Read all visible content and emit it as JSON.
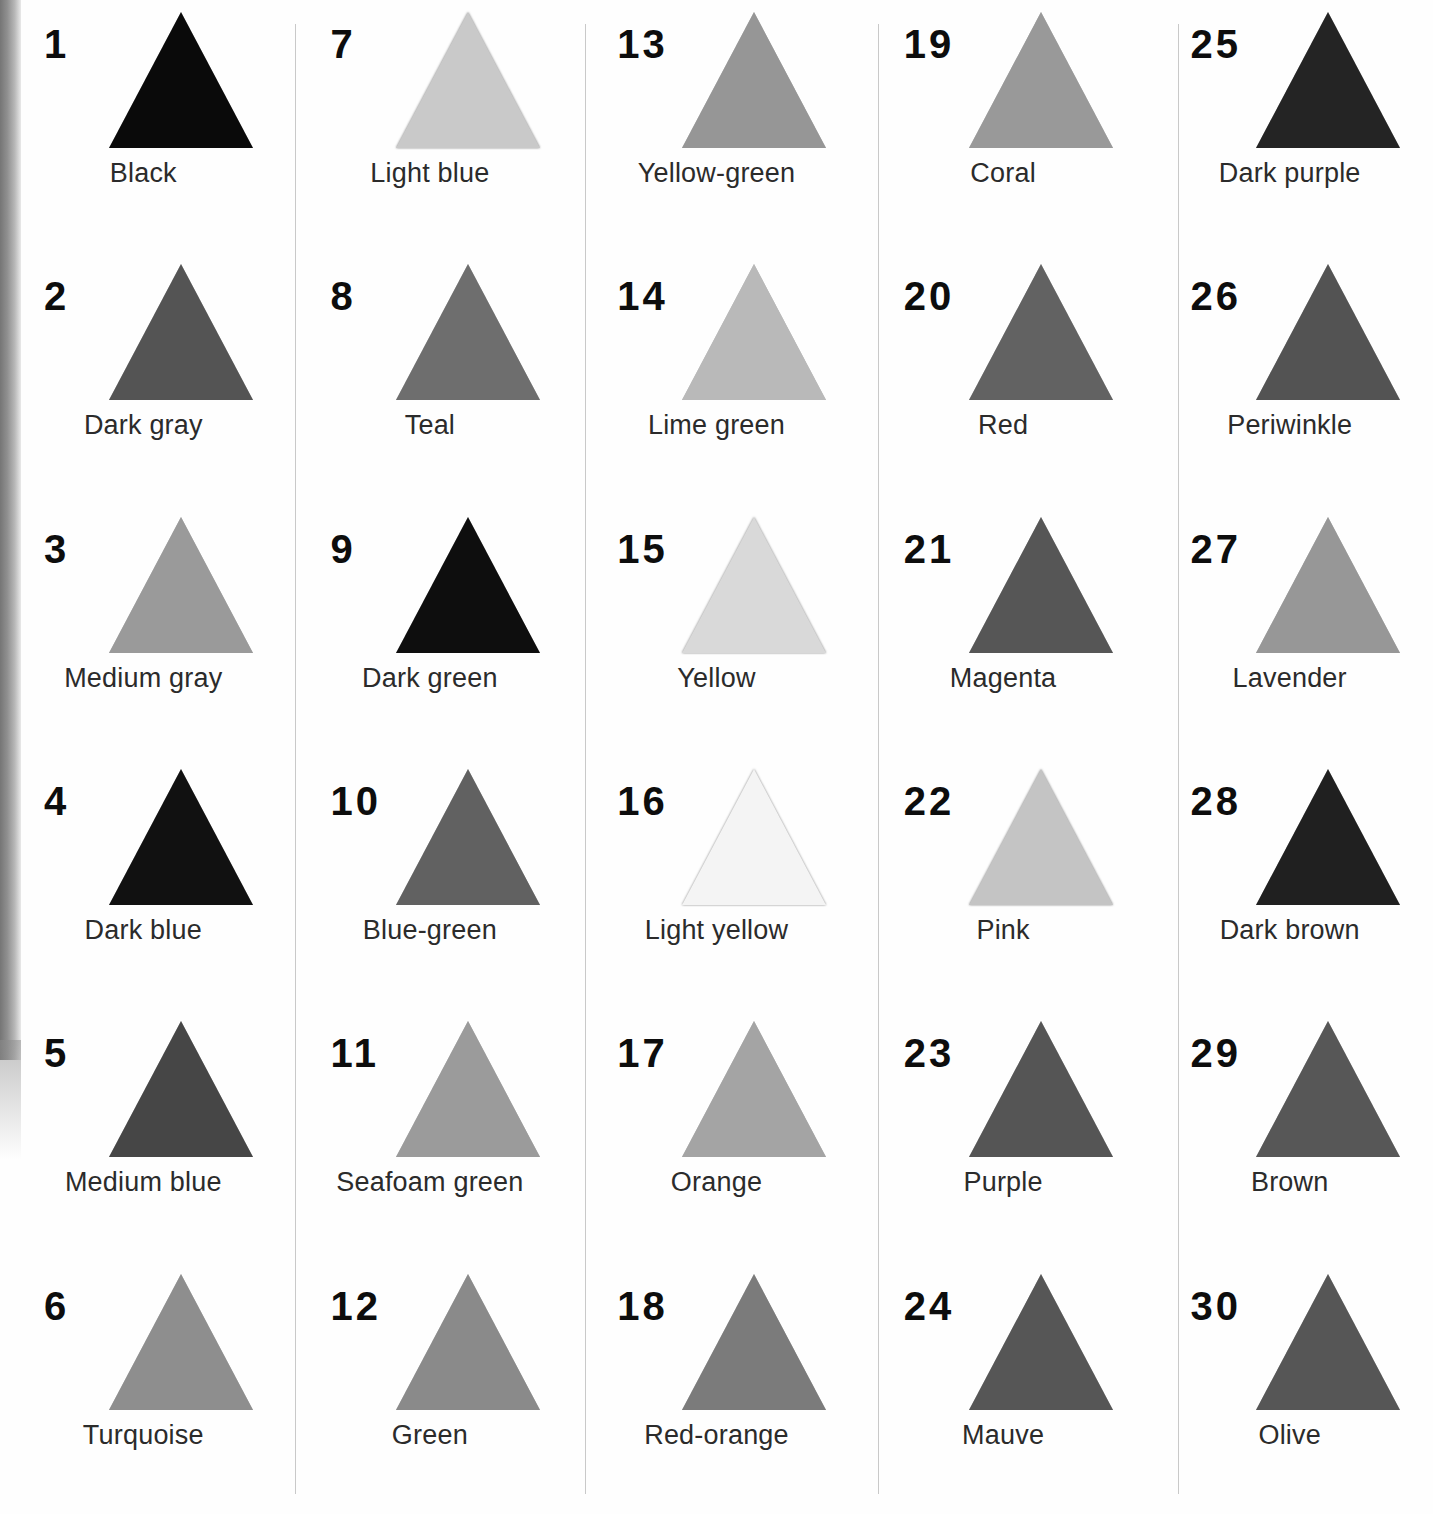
{
  "document": {
    "kind": "color-swatch-reference-chart",
    "columns": 5,
    "rows": 6,
    "total_swatches": 30,
    "shape": "triangle",
    "reproduction": "grayscale scan of a printed colour chart",
    "background_color": "#fefefe",
    "number_color": "#0d0d0d",
    "label_color": "#2b2b2b",
    "divider_color": "#c9c9c9",
    "scan_edge_color": "#6e6e6e"
  },
  "chart_data": {
    "type": "table",
    "xlabel": "",
    "ylabel": "",
    "legend": "none",
    "grid": false,
    "categories": [
      "Black",
      "Dark gray",
      "Medium gray",
      "Dark blue",
      "Medium blue",
      "Turquoise",
      "Light blue",
      "Teal",
      "Dark green",
      "Blue-green",
      "Seafoam green",
      "Green",
      "Yellow-green",
      "Lime green",
      "Yellow",
      "Light yellow",
      "Orange",
      "Red-orange",
      "Coral",
      "Red",
      "Magenta",
      "Pink",
      "Purple",
      "Mauve",
      "Dark purple",
      "Periwinkle",
      "Lavender",
      "Dark brown",
      "Brown",
      "Olive"
    ],
    "values": [
      8,
      75,
      150,
      16,
      62,
      140,
      200,
      108,
      13,
      95,
      150,
      132,
      148,
      185,
      216,
      243,
      162,
      122,
      152,
      96,
      84,
      196,
      84,
      86,
      35,
      82,
      150,
      32,
      86,
      86
    ],
    "value_meaning": "printed grayscale level of each triangle (0 = black, 255 = white)",
    "ylim": [
      0,
      255
    ]
  },
  "swatches": [
    {
      "number": "1",
      "label": "Black",
      "tone": "#0a0a0a",
      "light": false
    },
    {
      "number": "2",
      "label": "Dark gray",
      "tone": "#545454",
      "light": false
    },
    {
      "number": "3",
      "label": "Medium gray",
      "tone": "#9a9a9a",
      "light": false
    },
    {
      "number": "4",
      "label": "Dark blue",
      "tone": "#111111",
      "light": false
    },
    {
      "number": "5",
      "label": "Medium blue",
      "tone": "#464646",
      "light": false
    },
    {
      "number": "6",
      "label": "Turquoise",
      "tone": "#8e8e8e",
      "light": false
    },
    {
      "number": "7",
      "label": "Light blue",
      "tone": "#c9c9c9",
      "light": true
    },
    {
      "number": "8",
      "label": "Teal",
      "tone": "#6e6e6e",
      "light": false
    },
    {
      "number": "9",
      "label": "Dark green",
      "tone": "#0e0e0e",
      "light": false
    },
    {
      "number": "10",
      "label": "Blue-green",
      "tone": "#616161",
      "light": false
    },
    {
      "number": "11",
      "label": "Seafoam green",
      "tone": "#9b9b9b",
      "light": false
    },
    {
      "number": "12",
      "label": "Green",
      "tone": "#8a8a8a",
      "light": false
    },
    {
      "number": "13",
      "label": "Yellow-green",
      "tone": "#969696",
      "light": false
    },
    {
      "number": "14",
      "label": "Lime green",
      "tone": "#b9b9b9",
      "light": false
    },
    {
      "number": "15",
      "label": "Yellow",
      "tone": "#d9d9d9",
      "light": true
    },
    {
      "number": "16",
      "label": "Light yellow",
      "tone": "#f4f4f4",
      "light": true
    },
    {
      "number": "17",
      "label": "Orange",
      "tone": "#a4a4a4",
      "light": false
    },
    {
      "number": "18",
      "label": "Red-orange",
      "tone": "#7b7b7b",
      "light": false
    },
    {
      "number": "19",
      "label": "Coral",
      "tone": "#999999",
      "light": false
    },
    {
      "number": "20",
      "label": "Red",
      "tone": "#626262",
      "light": false
    },
    {
      "number": "21",
      "label": "Magenta",
      "tone": "#565656",
      "light": false
    },
    {
      "number": "22",
      "label": "Pink",
      "tone": "#c4c4c4",
      "light": true
    },
    {
      "number": "23",
      "label": "Purple",
      "tone": "#555555",
      "light": false
    },
    {
      "number": "24",
      "label": "Mauve",
      "tone": "#565656",
      "light": false
    },
    {
      "number": "25",
      "label": "Dark purple",
      "tone": "#242424",
      "light": false
    },
    {
      "number": "26",
      "label": "Periwinkle",
      "tone": "#535353",
      "light": false
    },
    {
      "number": "27",
      "label": "Lavender",
      "tone": "#979797",
      "light": false
    },
    {
      "number": "28",
      "label": "Dark brown",
      "tone": "#202020",
      "light": false
    },
    {
      "number": "29",
      "label": "Brown",
      "tone": "#575757",
      "light": false
    },
    {
      "number": "30",
      "label": "Olive",
      "tone": "#565656",
      "light": false
    }
  ]
}
